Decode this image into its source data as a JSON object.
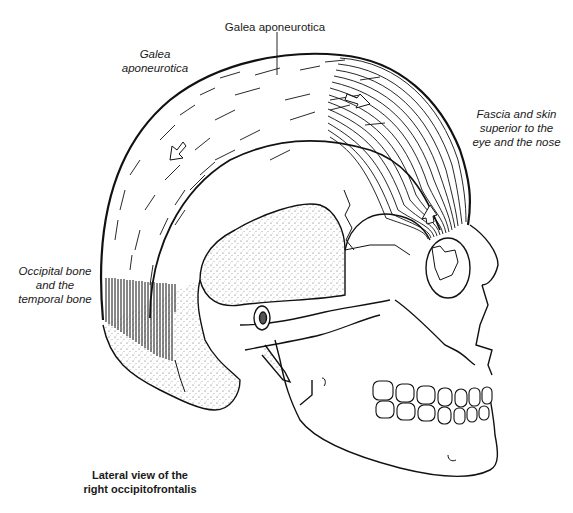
{
  "figure": {
    "title_line1": "Lateral view of the",
    "title_line2": "right occipitofrontalis",
    "colors": {
      "ink": "#111111",
      "background": "#ffffff",
      "stipple": "#444444"
    }
  },
  "labels": {
    "galea_top": "Galea aponeurotica",
    "galea_left_line1": "Galea",
    "galea_left_line2": "aponeurotica",
    "insertion_line1": "Fascia and skin",
    "insertion_line2": "superior to the",
    "insertion_line3": "eye and the nose",
    "origin_line1": "Occipital bone",
    "origin_line2": "and the",
    "origin_line3": "temporal bone"
  },
  "annotations": {
    "arrows": [
      {
        "name": "galea-arrow-front",
        "direction": "anterior"
      },
      {
        "name": "galea-arrow-back",
        "direction": "posterior"
      },
      {
        "name": "frontalis-arrow",
        "direction": "superior"
      }
    ]
  }
}
